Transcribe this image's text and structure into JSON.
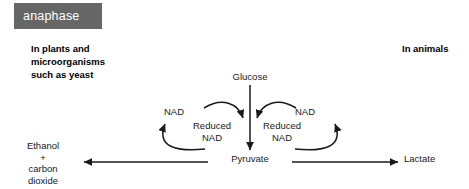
{
  "tag": {
    "label": "anaphase",
    "bg_color": "#666666",
    "text_color": "#ffffff"
  },
  "headings": {
    "left": "In plants and\nmicroorganisms\nsuch as yeast",
    "right": "In animals"
  },
  "diagram": {
    "type": "anaerobic-respiration-flow-diagram",
    "line_color": "#1a1a1a",
    "nodes": {
      "glucose": "Glucose",
      "pyruvate": "Pyruvate",
      "nad_left": "NAD",
      "nad_right": "NAD",
      "reduced_nad_left": "Reduced\nNAD",
      "reduced_nad_right": "Reduced\nNAD",
      "ethanol_carbon_dioxide": "Ethanol\n+\ncarbon\ndioxide",
      "lactate": "Lactate"
    },
    "arrows": [
      {
        "name": "glucose-to-pyruvate",
        "from": "Glucose",
        "to": "Pyruvate",
        "shape": "straight-vertical-down"
      },
      {
        "name": "nad-to-reduced-nad-left",
        "from": "NAD",
        "to": "Reduced NAD",
        "shape": "curved-arc-right-down"
      },
      {
        "name": "nad-to-reduced-nad-right",
        "from": "NAD",
        "to": "Reduced NAD",
        "shape": "curved-arc-left-down"
      },
      {
        "name": "reduced-nad-to-nad-left",
        "from": "Reduced NAD",
        "to": "NAD",
        "shape": "curved-loop-up-left"
      },
      {
        "name": "reduced-nad-to-nad-right",
        "from": "Reduced NAD",
        "to": "NAD",
        "shape": "curved-loop-up-right"
      },
      {
        "name": "pyruvate-to-ethanol",
        "from": "Pyruvate",
        "to": "Ethanol + carbon dioxide",
        "shape": "straight-horizontal-left"
      },
      {
        "name": "pyruvate-to-lactate",
        "from": "Pyruvate",
        "to": "Lactate",
        "shape": "straight-horizontal-right"
      }
    ]
  }
}
